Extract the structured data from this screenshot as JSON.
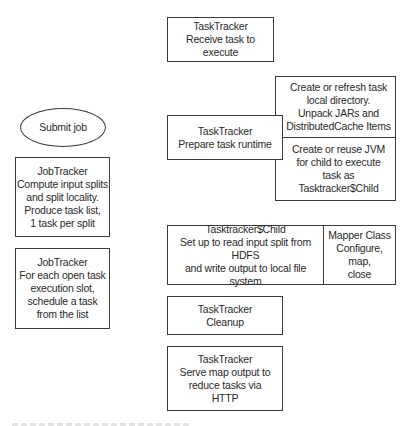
{
  "diagram": {
    "submit": {
      "label": "Submit job"
    },
    "jobtracker_compute": {
      "text": "JobTracker\nCompute input splits\nand split locality.\nProduce task list,\n1 task per split"
    },
    "jobtracker_schedule": {
      "text": "JobTracker\nFor each open task\nexecution slot,\nschedule a task\nfrom the list"
    },
    "tasktracker_receive": {
      "text": "TaskTracker\nReceive task to execute"
    },
    "tasktracker_prepare": {
      "text": "TaskTracker\nPrepare task runtime"
    },
    "prepare_details": {
      "top": "Create or refresh task\nlocal directory.\nUnpack JARs and\nDistributedCache Items",
      "bottom": "Create or reuse JVM\nfor child to execute\ntask as\nTasktracker$Child"
    },
    "child": {
      "left": "Tasktracker$Child\nSet up to read input split from HDFS\nand write output to local file system",
      "right": "Mapper Class\nConfigure,\nmap,\nclose"
    },
    "tasktracker_cleanup": {
      "text": "TaskTracker\nCleanup"
    },
    "tasktracker_serve": {
      "text": "TaskTracker\nServe map output to\nreduce tasks via\nHTTP"
    }
  },
  "colors": {
    "stroke": "#3a3a3a",
    "text": "#2a2a2a",
    "background": "#ffffff"
  }
}
